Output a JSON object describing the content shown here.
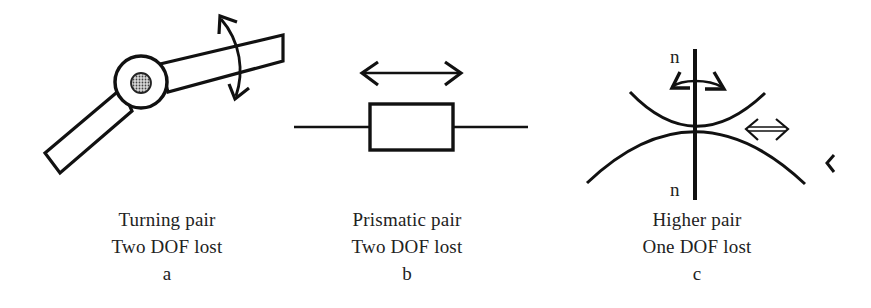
{
  "figure": {
    "panels": [
      {
        "id": "a",
        "title": "Turning pair",
        "dof_note": "Two DOF lost",
        "letter": "a",
        "elements": [
          "pin-joint",
          "link-upper",
          "link-lower",
          "rotation-arrow"
        ]
      },
      {
        "id": "b",
        "title": "Prismatic pair",
        "dof_note": "Two DOF lost",
        "letter": "b",
        "elements": [
          "rod",
          "slider-block",
          "translation-arrow"
        ]
      },
      {
        "id": "c",
        "title": "Higher pair",
        "dof_note": "One DOF lost",
        "letter": "c",
        "normal_label_top": "n",
        "normal_label_bottom": "n",
        "elements": [
          "upper-curve",
          "lower-curve",
          "normal-line",
          "rotation-arrows",
          "sliding-arrow"
        ]
      }
    ],
    "colors": {
      "stroke": "#111111",
      "background": "#ffffff",
      "pin_fill": "#8a8a8a"
    }
  }
}
